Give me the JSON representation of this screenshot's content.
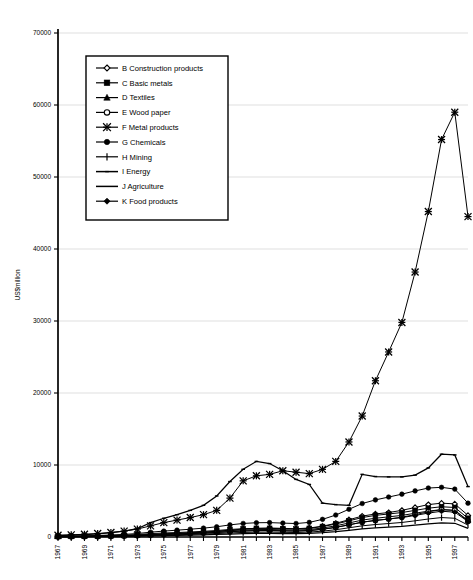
{
  "chart_data": {
    "type": "line",
    "title": "",
    "xlabel": "",
    "ylabel": "US$million",
    "ylim": [
      0,
      70000
    ],
    "ytick_labels": [
      "0",
      "10000",
      "20000",
      "30000",
      "40000",
      "50000",
      "60000",
      "70000"
    ],
    "ytick_values": [
      0,
      10000,
      20000,
      30000,
      40000,
      50000,
      60000,
      70000
    ],
    "grid": true,
    "legend_position": "upper-left-inset",
    "x": [
      1967,
      1968,
      1969,
      1970,
      1971,
      1972,
      1973,
      1974,
      1975,
      1976,
      1977,
      1978,
      1979,
      1980,
      1981,
      1982,
      1983,
      1984,
      1985,
      1986,
      1987,
      1988,
      1989,
      1990,
      1991,
      1992,
      1993,
      1994,
      1995,
      1996,
      1997,
      1998
    ],
    "xtick_labels": [
      "1967",
      "",
      "1969",
      "",
      "1971",
      "",
      "1973",
      "",
      "1975",
      "",
      "1977",
      "",
      "1979",
      "",
      "1981",
      "",
      "1983",
      "",
      "1985",
      "",
      "1987",
      "",
      "1989",
      "",
      "1991",
      "",
      "1993",
      "",
      "1995",
      "",
      "1997",
      ""
    ],
    "series": [
      {
        "name": "B Construction products",
        "key": "B",
        "marker": "diamond-open",
        "values": [
          60,
          70,
          85,
          100,
          130,
          170,
          230,
          330,
          420,
          500,
          580,
          680,
          800,
          950,
          1100,
          1200,
          1250,
          1200,
          1150,
          1250,
          1500,
          1900,
          2400,
          2900,
          3200,
          3400,
          3700,
          4100,
          4500,
          4700,
          4600,
          3000
        ]
      },
      {
        "name": "C Basic metals",
        "key": "C",
        "marker": "square-filled",
        "values": [
          90,
          100,
          120,
          150,
          200,
          260,
          340,
          470,
          560,
          620,
          700,
          790,
          900,
          1050,
          1150,
          1200,
          1200,
          1150,
          1100,
          1200,
          1450,
          1800,
          2250,
          2700,
          3000,
          3200,
          3400,
          3700,
          4000,
          4200,
          4100,
          2600
        ]
      },
      {
        "name": "D Textiles",
        "key": "D",
        "marker": "triangle-filled",
        "values": [
          70,
          80,
          95,
          115,
          150,
          190,
          250,
          350,
          430,
          500,
          570,
          650,
          750,
          880,
          980,
          1030,
          1040,
          1000,
          960,
          1040,
          1250,
          1550,
          1950,
          2350,
          2600,
          2800,
          3000,
          3300,
          3600,
          3800,
          3700,
          2300
        ]
      },
      {
        "name": "E Wood paper",
        "key": "E",
        "marker": "circle-open",
        "values": [
          50,
          58,
          70,
          85,
          110,
          145,
          195,
          280,
          350,
          410,
          470,
          540,
          630,
          740,
          830,
          880,
          890,
          850,
          820,
          890,
          1070,
          1330,
          1680,
          2050,
          2300,
          2500,
          2750,
          3100,
          3500,
          3800,
          3700,
          2200
        ]
      },
      {
        "name": "F Metal products",
        "key": "F",
        "marker": "star",
        "values": [
          250,
          300,
          380,
          480,
          620,
          820,
          1100,
          1550,
          2000,
          2350,
          2700,
          3100,
          3700,
          5400,
          7800,
          8500,
          8700,
          9200,
          9000,
          8800,
          9400,
          10500,
          13200,
          16800,
          21700,
          25700,
          29800,
          36800,
          45200,
          55200,
          59000,
          44500
        ]
      },
      {
        "name": "G Chemicals",
        "key": "G",
        "marker": "circle-filled",
        "values": [
          120,
          140,
          170,
          210,
          280,
          360,
          480,
          670,
          820,
          950,
          1080,
          1230,
          1420,
          1680,
          1880,
          1980,
          2000,
          1930,
          1870,
          2030,
          2450,
          3050,
          3850,
          4650,
          5150,
          5550,
          5950,
          6400,
          6800,
          6900,
          6650,
          4700
        ]
      },
      {
        "name": "H Mining",
        "key": "H",
        "marker": "plus",
        "values": [
          40,
          46,
          55,
          68,
          88,
          115,
          155,
          215,
          270,
          315,
          360,
          415,
          480,
          565,
          635,
          670,
          680,
          650,
          625,
          680,
          815,
          1010,
          1280,
          1550,
          1730,
          1870,
          2020,
          2250,
          2500,
          2700,
          2600,
          1650
        ]
      },
      {
        "name": "I Energy",
        "key": "I",
        "marker": "dash",
        "values": [
          200,
          260,
          340,
          450,
          600,
          820,
          1150,
          2000,
          2600,
          3100,
          3700,
          4400,
          5700,
          7700,
          9400,
          10500,
          10200,
          9200,
          8000,
          7300,
          4700,
          4500,
          4400,
          8700,
          8400,
          8350,
          8350,
          8600,
          9600,
          11500,
          11400,
          7000
        ]
      },
      {
        "name": "J Agriculture",
        "key": "J",
        "marker": "line",
        "values": [
          30,
          34,
          40,
          50,
          64,
          84,
          112,
          155,
          195,
          228,
          262,
          300,
          348,
          410,
          462,
          488,
          494,
          474,
          456,
          496,
          596,
          740,
          935,
          1130,
          1265,
          1365,
          1475,
          1645,
          1830,
          1975,
          1905,
          1190
        ]
      },
      {
        "name": "K Food products",
        "key": "K",
        "marker": "diamond-filled",
        "values": [
          55,
          62,
          75,
          92,
          118,
          155,
          205,
          285,
          355,
          415,
          478,
          548,
          635,
          748,
          840,
          888,
          898,
          862,
          828,
          900,
          1080,
          1345,
          1700,
          2060,
          2310,
          2495,
          2690,
          3000,
          3320,
          3580,
          3450,
          2150
        ]
      }
    ]
  }
}
